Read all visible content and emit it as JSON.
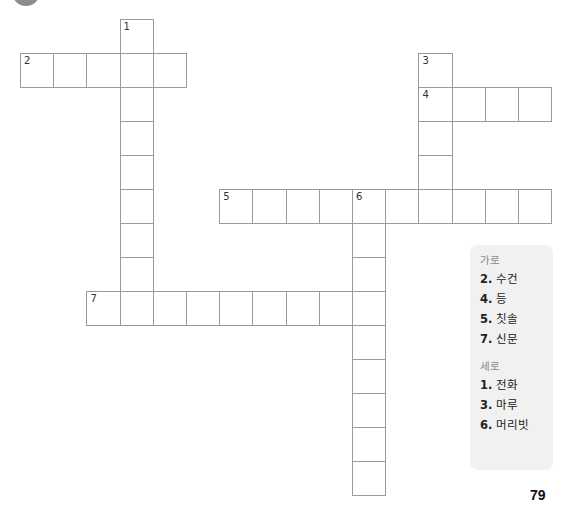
{
  "page": {
    "page_number": "79"
  },
  "grid": {
    "origin_x": 20,
    "origin_y": 19,
    "cell_width": 33.2,
    "cell_height": 34,
    "words": [
      {
        "number": "1",
        "direction": "down",
        "row": 0,
        "col": 3,
        "length": 9
      },
      {
        "number": "2",
        "direction": "across",
        "row": 1,
        "col": 0,
        "length": 5
      },
      {
        "number": "3",
        "direction": "down",
        "row": 1,
        "col": 12,
        "length": 5
      },
      {
        "number": "4",
        "direction": "across",
        "row": 2,
        "col": 12,
        "length": 4
      },
      {
        "number": "5",
        "direction": "across",
        "row": 5,
        "col": 6,
        "length": 10
      },
      {
        "number": "6",
        "direction": "down",
        "row": 5,
        "col": 10,
        "length": 9
      },
      {
        "number": "7",
        "direction": "across",
        "row": 8,
        "col": 2,
        "length": 9
      }
    ]
  },
  "clues": {
    "across_heading": "가로",
    "across": [
      {
        "num": "2.",
        "text": "수건"
      },
      {
        "num": "4.",
        "text": "등"
      },
      {
        "num": "5.",
        "text": "칫솔"
      },
      {
        "num": "7.",
        "text": "신문"
      }
    ],
    "down_heading": "세로",
    "down": [
      {
        "num": "1.",
        "text": "전화"
      },
      {
        "num": "3.",
        "text": "마루"
      },
      {
        "num": "6.",
        "text": "머리빗"
      }
    ]
  },
  "colors": {
    "cell_border": "#9a9a9a",
    "clue_box_bg": "#f1f1f1",
    "heading_text": "#8a8a8a",
    "circle_badge": "#8c8c8c"
  }
}
